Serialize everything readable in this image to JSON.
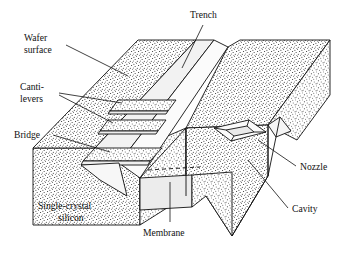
{
  "figure": {
    "name": "mems-bulk-micromachined-silicon-structures",
    "background_color": "#ffffff",
    "line_color": "#111111",
    "stipple_color": "#1a1a1a",
    "membrane_fill": "#ececec",
    "trench_wall_fill": "#f2f2f2"
  },
  "labels": {
    "trench": "Trench",
    "wafer_surface_line1": "Wafer",
    "wafer_surface_line2": "surface",
    "cantilevers_line1": "Canti-",
    "cantilevers_line2": "levers",
    "bridge": "Bridge",
    "single_crystal_line1": "Single-crystal",
    "single_crystal_line2": "silicon",
    "membrane": "Membrane",
    "nozzle": "Nozzle",
    "cavity": "Cavity"
  },
  "features": [
    {
      "id": "trench",
      "label": "Trench"
    },
    {
      "id": "wafer-surface",
      "label": "Wafer surface"
    },
    {
      "id": "cantilevers",
      "label": "Canti-levers"
    },
    {
      "id": "bridge",
      "label": "Bridge"
    },
    {
      "id": "single-crystal-silicon",
      "label": "Single-crystal silicon"
    },
    {
      "id": "membrane",
      "label": "Membrane"
    },
    {
      "id": "nozzle",
      "label": "Nozzle"
    },
    {
      "id": "cavity",
      "label": "Cavity"
    }
  ]
}
